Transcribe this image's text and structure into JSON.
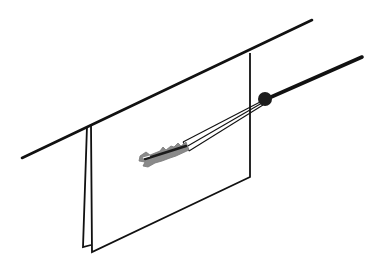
{
  "diagram": {
    "title": "Wall anchor installation illustration",
    "colors": {
      "background": "#ffffff",
      "stroke": "#111111",
      "anchor_fill": "#8a8a8a",
      "anchor_core": "#1a1a1a",
      "ball": "#1c1c1c"
    },
    "elements": [
      {
        "name": "top-line",
        "label": "Support line"
      },
      {
        "name": "panel",
        "label": "Panel / wallboard"
      },
      {
        "name": "rod",
        "label": "Insertion rod"
      },
      {
        "name": "ball-joint",
        "label": "Ball joint"
      },
      {
        "name": "anchor",
        "label": "Ribbed wall anchor"
      }
    ]
  }
}
